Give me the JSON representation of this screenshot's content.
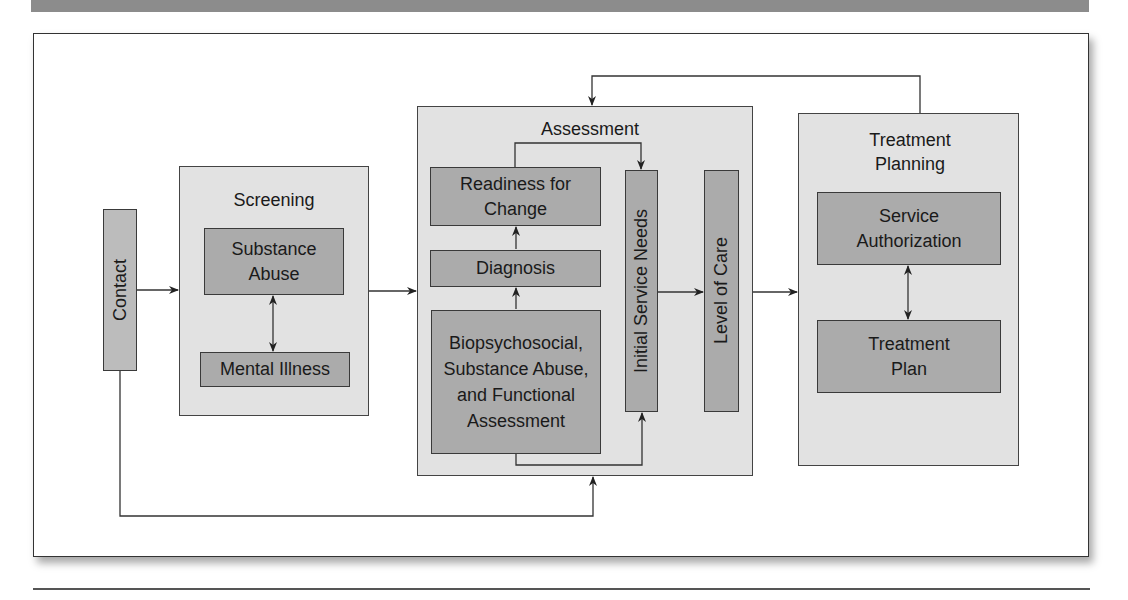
{
  "diagram": {
    "contact": {
      "label": "Contact"
    },
    "screening": {
      "title": "Screening",
      "substance_abuse": "Substance Abuse",
      "mental_illness": "Mental Illness"
    },
    "assessment": {
      "title": "Assessment",
      "readiness": "Readiness for Change",
      "diagnosis": "Diagnosis",
      "biopsychosocial": "Biopsychosocial, Substance Abuse, and Functional Assessment",
      "initial_service_needs": "Initial Service Needs",
      "level_of_care": "Level of Care"
    },
    "treatment_planning": {
      "title": "Treatment Planning",
      "service_authorization": "Service Authorization",
      "treatment_plan": "Treatment Plan"
    },
    "colors": {
      "panel": "#e2e2e2",
      "box": "#ababab",
      "line": "#333333",
      "topbar": "#8c8c8c"
    }
  }
}
